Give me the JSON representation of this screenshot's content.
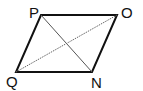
{
  "diagram": {
    "type": "parallelogram",
    "vertices": {
      "P": {
        "label": "P",
        "x": 41,
        "y": 15,
        "label_x": 29,
        "label_y": 18
      },
      "O": {
        "label": "O",
        "x": 117,
        "y": 15,
        "label_x": 121,
        "label_y": 18
      },
      "Q": {
        "label": "Q",
        "x": 16,
        "y": 72,
        "label_x": 6,
        "label_y": 87
      },
      "N": {
        "label": "N",
        "x": 92,
        "y": 72,
        "label_x": 91,
        "label_y": 88
      }
    },
    "sides": [
      "PO",
      "ON",
      "NQ",
      "QP"
    ],
    "diagonals": [
      {
        "name": "PN",
        "style": "solid-thin"
      },
      {
        "name": "QO",
        "style": "dotted"
      }
    ],
    "colors": {
      "line": "#111111",
      "diagonal": "#555555",
      "background": "#ffffff"
    }
  }
}
